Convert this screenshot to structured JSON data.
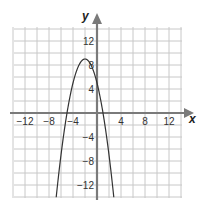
{
  "chart_data": {
    "type": "line",
    "title": "",
    "xlabel": "x",
    "ylabel": "y",
    "xlim": [
      -14,
      14
    ],
    "ylim": [
      -14,
      16
    ],
    "grid": true,
    "grid_step": 2,
    "x_ticks": [
      -12,
      -8,
      -4,
      4,
      8,
      12
    ],
    "x_tick_labels": [
      "−12",
      "−8",
      "−4",
      "4",
      "8",
      "12"
    ],
    "y_ticks": [
      12,
      8,
      4,
      -4,
      -8,
      -12
    ],
    "y_tick_labels": [
      "12",
      "8",
      "4",
      "−4",
      "−8",
      "−12"
    ],
    "series": [
      {
        "name": "parabola",
        "equation": "y = -x^2 - 4x + 5",
        "a": -1,
        "b": -4,
        "c": 5,
        "vertex": [
          -2,
          9
        ],
        "roots": [
          -5,
          1
        ],
        "y_intercept": 5,
        "color": "#333333"
      }
    ]
  },
  "colors": {
    "grid": "#c8c8c8",
    "axis": "#7a7a7a",
    "curve": "#333333"
  }
}
